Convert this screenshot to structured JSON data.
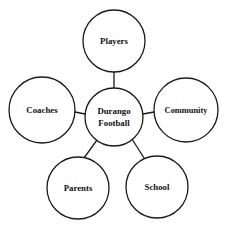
{
  "diagram": {
    "type": "hub-and-spoke-cluster",
    "background_color": "#ffffff",
    "stroke_color": "#1a1a1a",
    "text_color": "#111111",
    "center_node": {
      "id": "durango-football",
      "label_lines": [
        "Durango",
        "Football"
      ],
      "label": "Durango Football",
      "cx": 114,
      "cy": 117,
      "r": 29
    },
    "nodes": [
      {
        "id": "players",
        "label": "Players",
        "cx": 114,
        "cy": 41,
        "r": 31
      },
      {
        "id": "community",
        "label": "Community",
        "cx": 186,
        "cy": 110,
        "r": 32
      },
      {
        "id": "school",
        "label": "School",
        "cx": 157,
        "cy": 187,
        "r": 31
      },
      {
        "id": "parents",
        "label": "Parents",
        "cx": 78,
        "cy": 188,
        "r": 31
      },
      {
        "id": "coaches",
        "label": "Coaches",
        "cx": 42,
        "cy": 110,
        "r": 33
      }
    ],
    "edges": [
      {
        "from": "durango-football",
        "to": "players",
        "x1": 114,
        "y1": 88,
        "x2": 114,
        "y2": 72
      },
      {
        "from": "durango-football",
        "to": "community",
        "x1": 143,
        "y1": 114,
        "x2": 154,
        "y2": 112
      },
      {
        "from": "durango-football",
        "to": "school",
        "x1": 132,
        "y1": 139,
        "x2": 144,
        "y2": 158
      },
      {
        "from": "durango-football",
        "to": "parents",
        "x1": 97,
        "y1": 140,
        "x2": 84,
        "y2": 158
      },
      {
        "from": "durango-football",
        "to": "coaches",
        "x1": 85,
        "y1": 114,
        "x2": 75,
        "y2": 112
      }
    ]
  }
}
